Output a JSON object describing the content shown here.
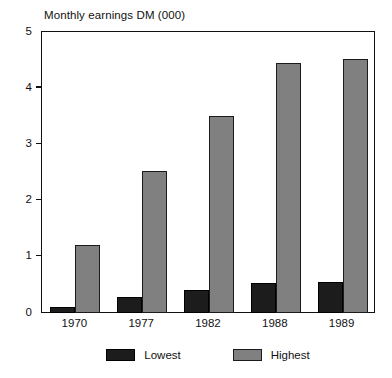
{
  "chart_data": {
    "type": "bar",
    "title": "Monthly earnings DM (000)",
    "xlabel": "",
    "ylabel": "",
    "ylim": [
      0,
      5
    ],
    "yticks": [
      "0",
      "1",
      "2",
      "3",
      "4",
      "5"
    ],
    "grid": false,
    "legend_position": "bottom",
    "categories": [
      "1970",
      "1977",
      "1982",
      "1988",
      "1989"
    ],
    "series": [
      {
        "name": "Lowest",
        "color": "#1c1c1c",
        "values": [
          0.1,
          0.27,
          0.4,
          0.53,
          0.55
        ]
      },
      {
        "name": "Highest",
        "color": "#808080",
        "values": [
          1.2,
          2.53,
          3.5,
          4.45,
          4.52
        ]
      }
    ]
  }
}
